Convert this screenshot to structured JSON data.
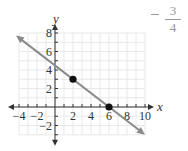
{
  "chart_data": {
    "type": "line",
    "title": "",
    "xlabel": "x",
    "ylabel": "y",
    "xlim": [
      -4,
      10
    ],
    "ylim": [
      -3,
      8
    ],
    "grid": true,
    "x_ticks": [
      -4,
      -2,
      2,
      4,
      6,
      8,
      10
    ],
    "y_ticks": [
      -2,
      2,
      4,
      6,
      8
    ],
    "x_tick_labels": [
      "−4",
      "−2",
      "2",
      "4",
      "6",
      "8",
      "10"
    ],
    "y_tick_labels": [
      "−2",
      "2",
      "4",
      "6",
      "8"
    ],
    "series": [
      {
        "name": "line",
        "equation": "y = -3/4 x + 9/2",
        "slope": -0.75,
        "y_intercept": 4.5,
        "x": [
          -4,
          10
        ],
        "y": [
          7.5,
          -3
        ],
        "color": "#8a8a8a",
        "arrows": "both"
      }
    ],
    "points": [
      {
        "x": 2,
        "y": 3
      },
      {
        "x": 6,
        "y": 0
      }
    ],
    "annotations": [
      {
        "text": "−3/4",
        "numerator": "3",
        "denominator": "4",
        "sign": "−",
        "position": "top-right"
      }
    ]
  },
  "annotation": {
    "sign": "−",
    "numerator": "3",
    "denominator": "4"
  }
}
